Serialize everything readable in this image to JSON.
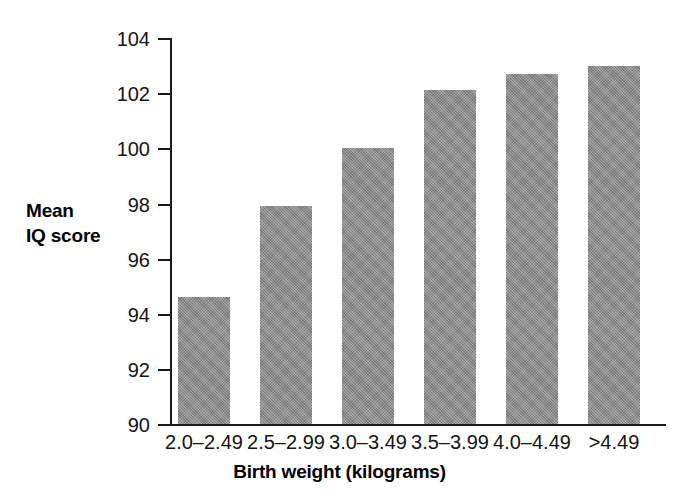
{
  "chart_data": {
    "type": "bar",
    "title": "",
    "subtitle": "",
    "xlabel": "Birth weight (kilograms)",
    "ylabel": "Mean IQ score",
    "ylabel_lines": [
      "Mean",
      "IQ score"
    ],
    "categories": [
      "2.0–2.49",
      "2.5–2.99",
      "3.0–3.49",
      "3.5–3.99",
      "4.0–4.49",
      ">4.49"
    ],
    "values": [
      94.6,
      97.9,
      100.0,
      102.1,
      102.7,
      103.0
    ],
    "ylim": [
      90,
      104
    ],
    "yticks": [
      90,
      92,
      94,
      96,
      98,
      100,
      102,
      104
    ],
    "ytick_labels": [
      "90",
      "92",
      "94",
      "96",
      "98",
      "100",
      "102",
      "104"
    ],
    "grid": false,
    "legend": null,
    "bar_color": "#8c8c8c",
    "axis_color": "#1a1a1a",
    "background_color": "#ffffff"
  }
}
